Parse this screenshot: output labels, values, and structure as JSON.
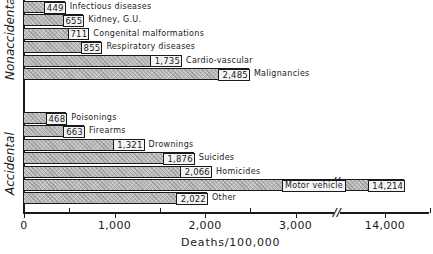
{
  "chart_data": {
    "type": "bar",
    "orientation": "horizontal",
    "title": "",
    "xlabel": "Deaths/100,000",
    "ylabel": "",
    "xlim": [
      0,
      14500
    ],
    "axis_break": {
      "from": 3500,
      "to": 13500
    },
    "x_ticks": [
      "0",
      "1,000",
      "2,000",
      "3,000",
      "14,000"
    ],
    "grid": false,
    "legend": null,
    "groups": [
      {
        "name": "Nonaccidental",
        "categories": [
          "Infectious diseases",
          "Kidney, G.U.",
          "Congenital malformations",
          "Respiratory diseases",
          "Cardio-vascular",
          "Malignancies"
        ],
        "values": [
          449,
          655,
          711,
          855,
          1735,
          2485
        ],
        "value_labels": [
          "449",
          "655",
          "711",
          "855",
          "1,735",
          "2,485"
        ]
      },
      {
        "name": "Accidental",
        "categories": [
          "Poisonings",
          "Firearms",
          "Drownings",
          "Suicides",
          "Homicides",
          "Motor vehicle",
          "Other"
        ],
        "values": [
          468,
          663,
          1321,
          1876,
          2066,
          14214,
          2022
        ],
        "value_labels": [
          "468",
          "663",
          "1,321",
          "1,876",
          "2,066",
          "14,214",
          "2,022"
        ]
      }
    ]
  },
  "colors": {
    "bar_fill": "#bdbdbd",
    "outline": "#1a1a1a",
    "background": "#ffffff"
  }
}
